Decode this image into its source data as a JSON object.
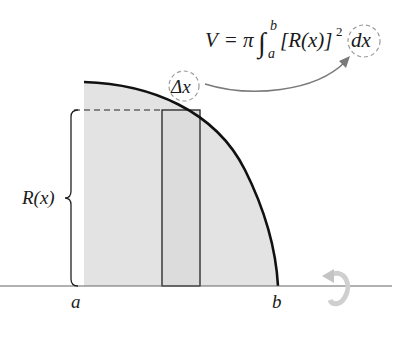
{
  "formula": {
    "V": "V",
    "equals": "=",
    "pi": "π",
    "integral": "∫",
    "upper_limit": "b",
    "lower_limit": "a",
    "integrand": "[R(x)]",
    "exponent": "2",
    "dx": "dx"
  },
  "labels": {
    "delta_x": "Δx",
    "radius": "R(x)",
    "a": "a",
    "b": "b"
  },
  "colors": {
    "region_fill": "#e3e3e3",
    "curve": "#111111",
    "axis": "#555555",
    "arrow": "#777777",
    "dashed_circle": "#999999",
    "rotation_arrow": "#c8c8c8"
  }
}
